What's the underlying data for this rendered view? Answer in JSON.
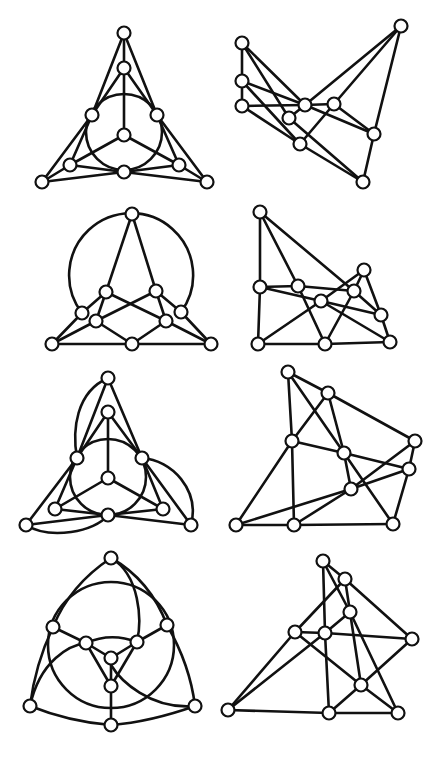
{
  "figure": {
    "colors": {
      "stroke": "#111111",
      "node_fill": "#ffffff",
      "background": "#ffffff"
    },
    "node_radius": 6.5,
    "panels": [
      {
        "id": "panel-1",
        "nodes": {
          "t": [
            124,
            33
          ],
          "m": [
            124,
            68
          ],
          "l": [
            92,
            115
          ],
          "r": [
            157,
            115
          ],
          "c": [
            124,
            135
          ],
          "li": [
            70,
            165
          ],
          "b": [
            124,
            172
          ],
          "ri": [
            179,
            165
          ],
          "lo": [
            42,
            182
          ],
          "ro": [
            207,
            182
          ]
        },
        "edges": [
          [
            "t",
            "m"
          ],
          [
            "t",
            "l"
          ],
          [
            "t",
            "r"
          ],
          [
            "m",
            "l"
          ],
          [
            "m",
            "r"
          ],
          [
            "m",
            "c"
          ],
          [
            "c",
            "li"
          ],
          [
            "c",
            "ri"
          ],
          [
            "l",
            "li"
          ],
          [
            "l",
            "lo"
          ],
          [
            "r",
            "ri"
          ],
          [
            "r",
            "ro"
          ],
          [
            "li",
            "lo"
          ],
          [
            "li",
            "b"
          ],
          [
            "ri",
            "ro"
          ],
          [
            "ri",
            "b"
          ],
          [
            "lo",
            "b"
          ],
          [
            "ro",
            "b"
          ]
        ],
        "circles": [
          [
            124,
            132,
            38
          ]
        ],
        "arcs": []
      },
      {
        "id": "panel-2",
        "nodes": {
          "a": [
            242,
            43
          ],
          "b": [
            401,
            26
          ],
          "c": [
            242,
            81
          ],
          "d": [
            242,
            106
          ],
          "e": [
            305,
            105
          ],
          "f": [
            334,
            104
          ],
          "g": [
            289,
            118
          ],
          "h": [
            374,
            134
          ],
          "i": [
            300,
            144
          ],
          "j": [
            363,
            182
          ]
        },
        "edges": [
          [
            "a",
            "c"
          ],
          [
            "c",
            "d"
          ],
          [
            "a",
            "e"
          ],
          [
            "a",
            "g"
          ],
          [
            "c",
            "e"
          ],
          [
            "c",
            "i"
          ],
          [
            "d",
            "e"
          ],
          [
            "d",
            "i"
          ],
          [
            "e",
            "f"
          ],
          [
            "e",
            "h"
          ],
          [
            "e",
            "b"
          ],
          [
            "f",
            "b"
          ],
          [
            "f",
            "h"
          ],
          [
            "f",
            "i"
          ],
          [
            "g",
            "e"
          ],
          [
            "g",
            "j"
          ],
          [
            "b",
            "h"
          ],
          [
            "h",
            "j"
          ],
          [
            "i",
            "j"
          ]
        ],
        "circles": [],
        "arcs": []
      },
      {
        "id": "panel-3",
        "nodes": {
          "t": [
            132,
            214
          ],
          "l1": [
            106,
            292
          ],
          "r1": [
            156,
            291
          ],
          "l2": [
            82,
            313
          ],
          "l3": [
            96,
            321
          ],
          "r2": [
            166,
            321
          ],
          "r3": [
            181,
            312
          ],
          "bl": [
            52,
            344
          ],
          "bm": [
            132,
            344
          ],
          "br": [
            211,
            344
          ]
        },
        "edges": [
          [
            "t",
            "l1"
          ],
          [
            "t",
            "r1"
          ],
          [
            "l1",
            "l2"
          ],
          [
            "l1",
            "l3"
          ],
          [
            "l1",
            "r2"
          ],
          [
            "r1",
            "r3"
          ],
          [
            "r1",
            "r2"
          ],
          [
            "r1",
            "l3"
          ],
          [
            "l2",
            "bl"
          ],
          [
            "l3",
            "bl"
          ],
          [
            "l3",
            "bm"
          ],
          [
            "r2",
            "bm"
          ],
          [
            "r2",
            "br"
          ],
          [
            "r3",
            "br"
          ],
          [
            "bl",
            "bm"
          ],
          [
            "bm",
            "br"
          ]
        ],
        "circles": [],
        "arcs": [
          "M 82 313 A 62 62 0 1 1 181 312"
        ]
      },
      {
        "id": "panel-4",
        "nodes": {
          "a": [
            260,
            212
          ],
          "b": [
            260,
            287
          ],
          "c": [
            298,
            286
          ],
          "d": [
            321,
            301
          ],
          "e": [
            354,
            291
          ],
          "f": [
            364,
            270
          ],
          "g": [
            381,
            315
          ],
          "h": [
            258,
            344
          ],
          "i": [
            325,
            344
          ],
          "j": [
            390,
            342
          ]
        },
        "edges": [
          [
            "a",
            "b"
          ],
          [
            "a",
            "c"
          ],
          [
            "a",
            "e"
          ],
          [
            "b",
            "c"
          ],
          [
            "b",
            "d"
          ],
          [
            "b",
            "h"
          ],
          [
            "c",
            "e"
          ],
          [
            "c",
            "i"
          ],
          [
            "d",
            "f"
          ],
          [
            "d",
            "g"
          ],
          [
            "d",
            "h"
          ],
          [
            "d",
            "j"
          ],
          [
            "e",
            "g"
          ],
          [
            "e",
            "i"
          ],
          [
            "f",
            "g"
          ],
          [
            "f",
            "e"
          ],
          [
            "g",
            "j"
          ],
          [
            "h",
            "i"
          ],
          [
            "i",
            "j"
          ]
        ],
        "circles": [],
        "arcs": []
      },
      {
        "id": "panel-5",
        "nodes": {
          "t": [
            108,
            378
          ],
          "m": [
            108,
            412
          ],
          "l": [
            77,
            458
          ],
          "r": [
            142,
            458
          ],
          "c": [
            108,
            478
          ],
          "li": [
            55,
            509
          ],
          "b": [
            108,
            515
          ],
          "ri": [
            163,
            509
          ],
          "lo": [
            26,
            525
          ],
          "ro": [
            191,
            525
          ]
        },
        "edges": [
          [
            "t",
            "l"
          ],
          [
            "t",
            "r"
          ],
          [
            "m",
            "l"
          ],
          [
            "m",
            "r"
          ],
          [
            "m",
            "c"
          ],
          [
            "c",
            "li"
          ],
          [
            "c",
            "ri"
          ],
          [
            "l",
            "li"
          ],
          [
            "l",
            "lo"
          ],
          [
            "r",
            "ri"
          ],
          [
            "r",
            "ro"
          ],
          [
            "li",
            "b"
          ],
          [
            "ri",
            "b"
          ],
          [
            "lo",
            "b"
          ],
          [
            "ro",
            "b"
          ]
        ],
        "circles": [
          [
            108,
            477,
            38
          ]
        ],
        "arcs": [
          "M 108 378 C 76 392 72 430 77 458",
          "M 142 458 C 172 460 200 490 191 525",
          "M 26 525 C 50 540 95 532 108 515"
        ]
      },
      {
        "id": "panel-6",
        "nodes": {
          "a": [
            288,
            372
          ],
          "b": [
            328,
            393
          ],
          "c": [
            292,
            441
          ],
          "d": [
            344,
            453
          ],
          "e": [
            415,
            441
          ],
          "f": [
            409,
            469
          ],
          "g": [
            351,
            489
          ],
          "h": [
            236,
            525
          ],
          "i": [
            294,
            525
          ],
          "j": [
            393,
            524
          ]
        },
        "edges": [
          [
            "a",
            "b"
          ],
          [
            "a",
            "c"
          ],
          [
            "a",
            "d"
          ],
          [
            "b",
            "c"
          ],
          [
            "b",
            "d"
          ],
          [
            "b",
            "e"
          ],
          [
            "c",
            "d"
          ],
          [
            "c",
            "h"
          ],
          [
            "c",
            "i"
          ],
          [
            "d",
            "f"
          ],
          [
            "d",
            "g"
          ],
          [
            "d",
            "j"
          ],
          [
            "e",
            "f"
          ],
          [
            "e",
            "g"
          ],
          [
            "f",
            "g"
          ],
          [
            "f",
            "j"
          ],
          [
            "g",
            "h"
          ],
          [
            "g",
            "i"
          ],
          [
            "h",
            "i"
          ],
          [
            "i",
            "j"
          ]
        ],
        "circles": [],
        "arcs": []
      },
      {
        "id": "panel-7",
        "nodes": {
          "t": [
            111,
            558
          ],
          "l": [
            53,
            627
          ],
          "r": [
            167,
            625
          ],
          "il": [
            86,
            643
          ],
          "ir": [
            137,
            642
          ],
          "c": [
            111,
            658
          ],
          "c2": [
            111,
            686
          ],
          "bl": [
            30,
            706
          ],
          "bm": [
            111,
            725
          ],
          "br": [
            195,
            706
          ]
        },
        "edges": [
          [
            "l",
            "il"
          ],
          [
            "r",
            "ir"
          ],
          [
            "il",
            "c2"
          ],
          [
            "ir",
            "c2"
          ],
          [
            "c",
            "c2"
          ],
          [
            "c2",
            "bm"
          ]
        ],
        "circles": [
          [
            111,
            645,
            63
          ]
        ],
        "arcs": [
          "M 111 558 Q 70 585 53 627",
          "M 111 558 Q 150 580 167 625",
          "M 53 627 Q 35 665 30 706",
          "M 167 625 Q 190 665 195 706",
          "M 30 706 Q 70 722 111 725",
          "M 195 706 Q 150 722 111 725",
          "M 111 558 C 140 575 142 620 137 642",
          "M 30 706 C 40 660 70 645 86 643",
          "M 195 706 C 150 710 120 680 111 665",
          "M 86 643 Q 111 632 137 642",
          "M 86 643 L 111 658 L 137 642"
        ]
      },
      {
        "id": "panel-8",
        "nodes": {
          "a": [
            323,
            561
          ],
          "b": [
            345,
            579
          ],
          "c": [
            350,
            612
          ],
          "d": [
            295,
            632
          ],
          "e": [
            325,
            633
          ],
          "f": [
            412,
            639
          ],
          "g": [
            361,
            685
          ],
          "h": [
            228,
            710
          ],
          "i": [
            329,
            713
          ],
          "j": [
            398,
            713
          ]
        },
        "edges": [
          [
            "a",
            "b"
          ],
          [
            "a",
            "e"
          ],
          [
            "a",
            "c"
          ],
          [
            "b",
            "d"
          ],
          [
            "b",
            "c"
          ],
          [
            "b",
            "f"
          ],
          [
            "c",
            "e"
          ],
          [
            "c",
            "g"
          ],
          [
            "c",
            "j"
          ],
          [
            "d",
            "e"
          ],
          [
            "d",
            "g"
          ],
          [
            "d",
            "h"
          ],
          [
            "e",
            "f"
          ],
          [
            "e",
            "i"
          ],
          [
            "e",
            "h"
          ],
          [
            "f",
            "g"
          ],
          [
            "g",
            "i"
          ],
          [
            "g",
            "j"
          ],
          [
            "h",
            "i"
          ],
          [
            "i",
            "j"
          ]
        ],
        "circles": [],
        "arcs": []
      }
    ]
  }
}
